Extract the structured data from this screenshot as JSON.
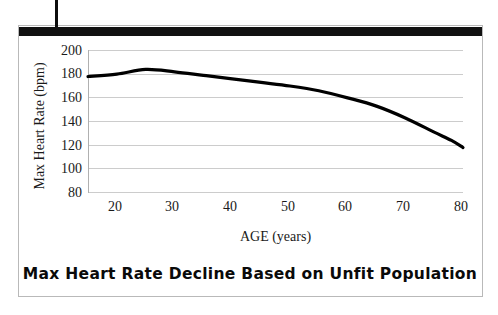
{
  "figure": {
    "title": "Max Heart Rate Decline Based on Unfit Population",
    "accent_color": "#111111",
    "border_color": "#b9b9b9",
    "gridline_color": "#cccccc",
    "curve_color": "#000000",
    "background_color": "#ffffff"
  },
  "chart_data": {
    "type": "line",
    "title": "Max Heart Rate Decline Based on Unfit Population",
    "xlabel": "AGE (years)",
    "ylabel": "Max Heart Rate (bpm)",
    "xlim": [
      15,
      80
    ],
    "ylim": [
      80,
      200
    ],
    "xticks": [
      20,
      30,
      40,
      50,
      60,
      70,
      80
    ],
    "yticks": [
      80,
      100,
      120,
      140,
      160,
      180,
      200
    ],
    "grid": true,
    "legend": "none",
    "series": [
      {
        "name": "Max Heart Rate",
        "x": [
          15,
          20,
          25,
          30,
          35,
          40,
          45,
          50,
          55,
          60,
          65,
          70,
          75,
          78,
          80
        ],
        "values": [
          178,
          180,
          184,
          182,
          179,
          176,
          173,
          170,
          166,
          160,
          153,
          143,
          131,
          124,
          118
        ]
      }
    ]
  },
  "axes": {
    "y_tick_labels": [
      "200",
      "180",
      "160",
      "140",
      "120",
      "100",
      "80"
    ],
    "x_tick_labels": [
      "20",
      "30",
      "40",
      "50",
      "60",
      "70",
      "80"
    ],
    "y_axis_title": "Max Heart Rate (bpm)",
    "x_axis_title": "AGE (years)"
  }
}
